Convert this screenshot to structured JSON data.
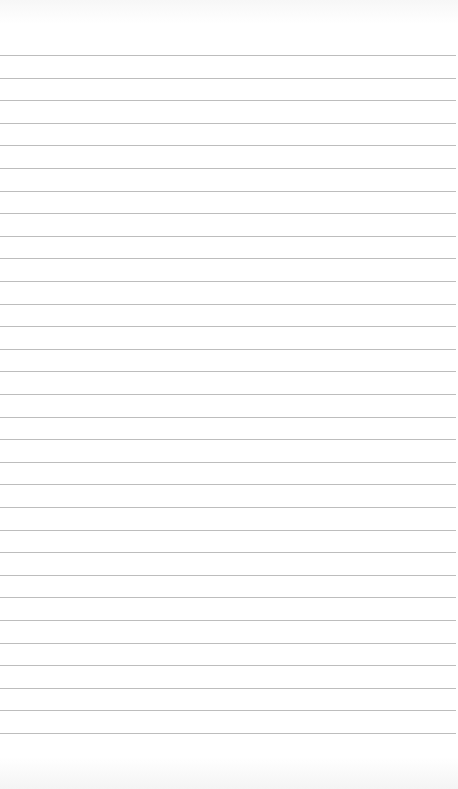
{
  "paper": {
    "type": "ruled-sheet",
    "line_count": 31,
    "first_line_y": 55,
    "line_spacing": 22.6,
    "line_color": "#bdbdbd",
    "background": "#ffffff",
    "text": ""
  }
}
